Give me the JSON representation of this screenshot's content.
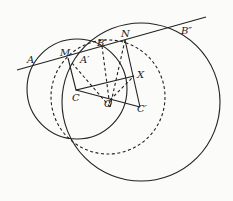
{
  "diagram": {
    "labels": {
      "A": "A",
      "M": "M",
      "A1": "A′",
      "B1": "B′",
      "N": "N",
      "B2": "B″",
      "X": "X",
      "C": "C",
      "O": "O",
      "C1": "C′"
    },
    "colors": {
      "stroke": "#222222",
      "background": "#fbfbf9"
    }
  }
}
